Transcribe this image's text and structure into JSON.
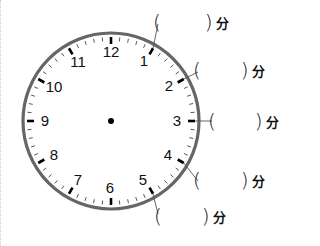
{
  "clock": {
    "center": [
      111,
      121
    ],
    "radius": 89,
    "ring_color": "#666666",
    "numbers": [
      "12",
      "1",
      "2",
      "3",
      "4",
      "5",
      "6",
      "7",
      "8",
      "9",
      "10",
      "11"
    ]
  },
  "answers": [
    {
      "hour_mark": "1",
      "open": "(",
      "value": "",
      "close": ")",
      "unit": "分"
    },
    {
      "hour_mark": "2",
      "open": "(",
      "value": "",
      "close": ")",
      "unit": "分"
    },
    {
      "hour_mark": "3",
      "open": "(",
      "value": "",
      "close": ")",
      "unit": "分"
    },
    {
      "hour_mark": "4",
      "open": "(",
      "value": "",
      "close": ")",
      "unit": "分"
    },
    {
      "hour_mark": "5",
      "open": "(",
      "value": "",
      "close": ")",
      "unit": "分"
    }
  ]
}
